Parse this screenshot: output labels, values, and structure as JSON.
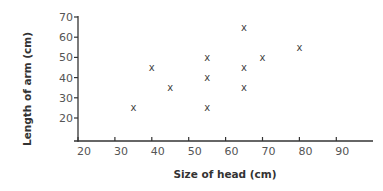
{
  "chart_data": {
    "type": "scatter",
    "title": "",
    "xlabel": "Size of head (cm)",
    "ylabel": "Length of arm (cm)",
    "xlim": [
      20,
      98
    ],
    "ylim": [
      9,
      72
    ],
    "x_ticks": [
      20,
      30,
      40,
      50,
      60,
      70,
      80,
      90
    ],
    "y_ticks": [
      20,
      30,
      40,
      50,
      60,
      70
    ],
    "grid": false,
    "legend": null,
    "marker": "x",
    "points": [
      {
        "x": 35,
        "y": 25
      },
      {
        "x": 40,
        "y": 45
      },
      {
        "x": 45,
        "y": 35
      },
      {
        "x": 55,
        "y": 50
      },
      {
        "x": 55,
        "y": 40
      },
      {
        "x": 55,
        "y": 25
      },
      {
        "x": 65,
        "y": 65
      },
      {
        "x": 65,
        "y": 45
      },
      {
        "x": 65,
        "y": 35
      },
      {
        "x": 70,
        "y": 50
      },
      {
        "x": 80,
        "y": 55
      }
    ]
  },
  "colors": {
    "axis": "#333333",
    "marker": "#444444",
    "tick_label": "#555555"
  }
}
